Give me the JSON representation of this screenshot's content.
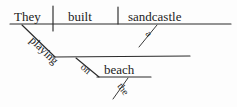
{
  "diagram": {
    "type": "reed-kellogg-sentence-diagram",
    "sentence": "They built a sandcastle playing on the beach",
    "ink_color": "#1c1c1c",
    "background_color": "#fdfdfd",
    "words": {
      "subject": "They",
      "verb": "built",
      "direct_object": "sandcastle",
      "object_article": "a",
      "participle": "playing",
      "preposition": "on",
      "prep_object": "beach",
      "prep_object_article": "the"
    },
    "labels": [
      {
        "id": "subject",
        "text": "They",
        "role": "subject",
        "x": 14,
        "y": 21,
        "slanted": false
      },
      {
        "id": "verb",
        "text": "built",
        "role": "verb",
        "x": 68,
        "y": 21,
        "slanted": false
      },
      {
        "id": "direct-object",
        "text": "sandcastle",
        "role": "direct-object",
        "x": 128,
        "y": 21,
        "slanted": false
      },
      {
        "id": "object-article",
        "text": "a",
        "role": "article-modifier",
        "x": 148,
        "y": 36,
        "slanted": true
      },
      {
        "id": "participle",
        "text": "playing",
        "role": "participial-phrase",
        "x": 36,
        "y": 44,
        "slanted": true
      },
      {
        "id": "preposition",
        "text": "on",
        "role": "preposition",
        "x": 86,
        "y": 73,
        "slanted": true
      },
      {
        "id": "prep-object",
        "text": "beach",
        "role": "object-of-preposition",
        "x": 104,
        "y": 74,
        "slanted": false
      },
      {
        "id": "prep-object-article",
        "text": "the",
        "role": "article-modifier",
        "x": 117,
        "y": 88,
        "slanted": true
      }
    ],
    "lines": {
      "main_baseline": {
        "x1": 10,
        "y1": 24,
        "x2": 231,
        "y2": 24
      },
      "subject_verb_divider": {
        "x1": 53,
        "y1": 6,
        "x2": 53,
        "y2": 31
      },
      "verb_object_divider": {
        "x1": 118,
        "y1": 7,
        "x2": 118,
        "y2": 24
      },
      "object_article_slant": {
        "x1": 157,
        "y1": 25,
        "x2": 139,
        "y2": 47
      },
      "participle_slant": {
        "x1": 22,
        "y1": 25,
        "x2": 55,
        "y2": 57
      },
      "participle_baseline": {
        "x1": 53,
        "y1": 57,
        "x2": 190,
        "y2": 56
      },
      "preposition_slant": {
        "x1": 76,
        "y1": 58,
        "x2": 99,
        "y2": 77
      },
      "prep_object_baseline": {
        "x1": 97,
        "y1": 77,
        "x2": 151,
        "y2": 77
      },
      "prep_article_slant": {
        "x1": 128,
        "y1": 78,
        "x2": 113,
        "y2": 99
      }
    }
  }
}
